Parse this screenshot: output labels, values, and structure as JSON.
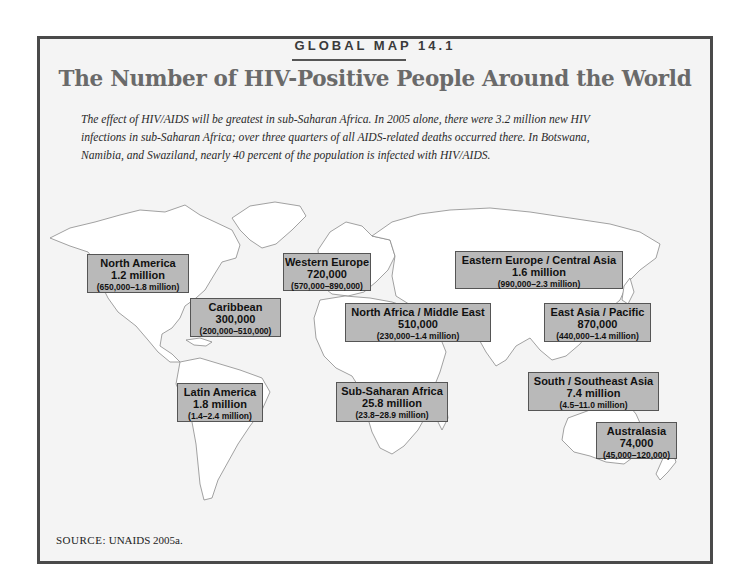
{
  "figure": {
    "kicker": "GLOBAL MAP 14.1",
    "title": "The Number of HIV-Positive People Around the World",
    "intro": "The effect of HIV/AIDS will be greatest in sub-Saharan Africa. In 2005 alone, there were 3.2 million new HIV infections in sub-Saharan Africa; over three quarters of all AIDS-related deaths occurred there. In Botswana, Namibia, and Swaziland, nearly 40 percent of the population is infected with HIV/AIDS.",
    "source_label": "SOURCE:",
    "source_text": "UNAIDS 2005a."
  },
  "regions": [
    {
      "name": "North America",
      "value": "1.2 million",
      "range": "(650,000–1.8 million)"
    },
    {
      "name": "Western Europe",
      "value": "720,000",
      "range": "(570,000–890,000)"
    },
    {
      "name": "Eastern Europe / Central Asia",
      "value": "1.6 million",
      "range": "(990,000–2.3 million)"
    },
    {
      "name": "Caribbean",
      "value": "300,000",
      "range": "(200,000–510,000)"
    },
    {
      "name": "North Africa / Middle East",
      "value": "510,000",
      "range": "(230,000–1.4 million)"
    },
    {
      "name": "East Asia / Pacific",
      "value": "870,000",
      "range": "(440,000–1.4 million)"
    },
    {
      "name": "South / Southeast Asia",
      "value": "7.4 million",
      "range": "(4.5–11.0 million)"
    },
    {
      "name": "Latin America",
      "value": "1.8 million",
      "range": "(1.4–2.4 million)"
    },
    {
      "name": "Sub-Saharan Africa",
      "value": "25.8 million",
      "range": "(23.8–28.9 million)"
    },
    {
      "name": "Australasia",
      "value": "74,000",
      "range": "(45,000–120,000)"
    }
  ],
  "colors": {
    "frame": "#4a4a4a",
    "background": "#f4f4f4",
    "label_box": "#b9b9b9",
    "land": "#ffffff",
    "borders": "#8a8a8a"
  }
}
